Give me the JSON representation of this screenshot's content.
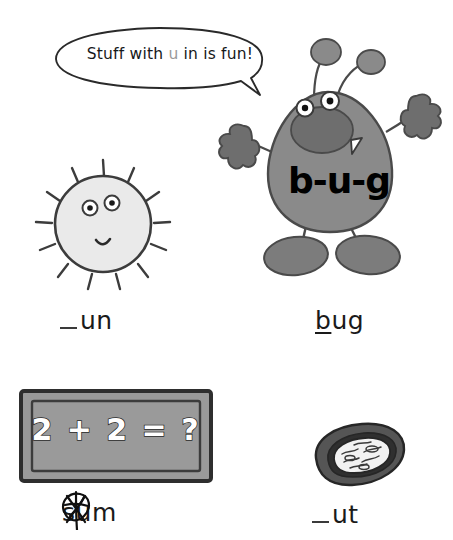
{
  "worksheet": {
    "target_letter": "u",
    "speech_bubble": {
      "text_before": "Stuff with ",
      "highlight": "u",
      "text_after": " in is fun!"
    },
    "items": [
      {
        "id": "sun",
        "picture": "sun-with-face",
        "label_blank": "_",
        "label_rest": "un",
        "answer_filled": false,
        "full_word": "sun"
      },
      {
        "id": "bug",
        "picture": "bug-character",
        "label_blank": "b",
        "label_rest": "ug",
        "answer_filled": true,
        "full_word": "bug",
        "body_word": "b-u-g"
      },
      {
        "id": "sum",
        "picture": "blackboard-with-sum",
        "board_text": "2 + 2 = ?",
        "label_blank": "s",
        "label_rest": "um",
        "answer_filled": true,
        "answer_scribbled_out": true,
        "full_word": "sum"
      },
      {
        "id": "nut",
        "picture": "cracked-nut",
        "label_blank": "_",
        "label_rest": "ut",
        "answer_filled": false,
        "full_word": "nut"
      }
    ]
  },
  "colors": {
    "ink": "#1a1a1a",
    "bug_body": "#8a8a8a",
    "bug_dark": "#6e6e6e",
    "sun_fill": "#eaeaea",
    "board_fill": "#9a9a9a",
    "board_frame": "#6f6f6f",
    "nut_shell": "#555555",
    "nut_kernel": "#f2f2f2",
    "highlight_letter": "#9a9a9a",
    "page_background": "#ffffff"
  }
}
